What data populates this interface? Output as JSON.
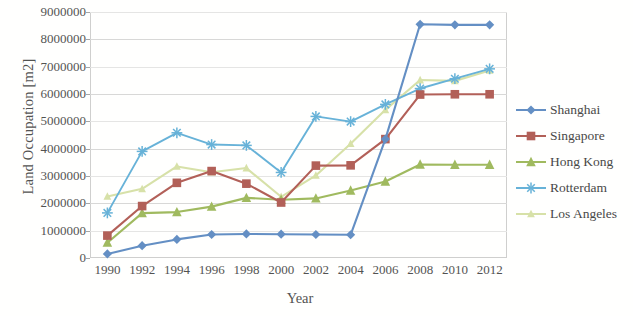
{
  "chart_data": {
    "type": "line",
    "title": "",
    "xlabel": "Year",
    "ylabel": "Land Occupation [m2]",
    "x": [
      1990,
      1992,
      1994,
      1996,
      1998,
      2000,
      2002,
      2004,
      2006,
      2008,
      2010,
      2012
    ],
    "xticklabels": [
      "1990",
      "1992",
      "1994",
      "1996",
      "1998",
      "2000",
      "2002",
      "2004",
      "2006",
      "2008",
      "2010",
      "2012"
    ],
    "yticklabels": [
      "0",
      "1000000",
      "2000000",
      "3000000",
      "4000000",
      "5000000",
      "6000000",
      "7000000",
      "8000000",
      "9000000"
    ],
    "ylim": [
      0,
      9000000
    ],
    "ytick_step": 1000000,
    "grid": true,
    "legend_position": "right",
    "series": [
      {
        "name": "Shanghai",
        "color": "#4f80bd",
        "marker": "diamond",
        "values": [
          150000,
          450000,
          680000,
          860000,
          880000,
          870000,
          860000,
          850000,
          4350000,
          8550000,
          8530000,
          8530000
        ]
      },
      {
        "name": "Singapore",
        "color": "#a84a43",
        "marker": "square",
        "values": [
          820000,
          1900000,
          2750000,
          3180000,
          2720000,
          2030000,
          3380000,
          3390000,
          4350000,
          5980000,
          5990000,
          5990000
        ]
      },
      {
        "name": "Hong Kong",
        "color": "#93b14b",
        "marker": "triangle",
        "values": [
          560000,
          1640000,
          1680000,
          1880000,
          2200000,
          2130000,
          2180000,
          2470000,
          2800000,
          3420000,
          3410000,
          3410000
        ]
      },
      {
        "name": "Rotterdam",
        "color": "#53a8d4",
        "marker": "star",
        "values": [
          1650000,
          3900000,
          4580000,
          4150000,
          4120000,
          3130000,
          5180000,
          4990000,
          5620000,
          6200000,
          6560000,
          6920000
        ]
      },
      {
        "name": "Los Angeles",
        "color": "#d2dd9e",
        "marker": "triangle-small",
        "values": [
          2250000,
          2530000,
          3350000,
          3140000,
          3290000,
          2240000,
          3020000,
          4180000,
          5420000,
          6510000,
          6480000,
          6860000
        ]
      }
    ]
  }
}
